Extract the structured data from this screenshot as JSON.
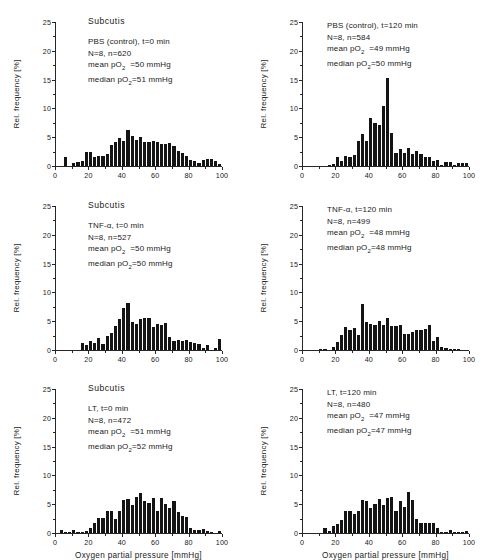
{
  "figure": {
    "xlabel": "Oxygen partial pressure [mmHg]",
    "ylabel": "Rel. frequency [%]",
    "xticks": [
      "0",
      "20",
      "40",
      "60",
      "80",
      "100"
    ],
    "yticks": [
      "0",
      "5",
      "10",
      "15",
      "20",
      "25"
    ],
    "tissue_title": "Subcutis"
  },
  "chart_data": [
    {
      "id": "pbs-t0",
      "type": "bar",
      "title": "Subcutis",
      "xlabel": "Oxygen partial pressure [mmHg]",
      "ylabel": "Rel. frequency [%]",
      "xlim": [
        0,
        100
      ],
      "ylim": [
        0,
        25
      ],
      "grid": false,
      "bin_width": 2.5,
      "annotations": {
        "condition": "PBS (control), t=0 min",
        "counts": "N=8, n=620",
        "mean": "mean pO2  =50 mmHg",
        "median": "median pO2=51 mmHg",
        "mean_value": 50,
        "median_value": 51,
        "N": 8,
        "n": 620
      },
      "x": [
        1.25,
        3.75,
        6.25,
        8.75,
        11.25,
        13.75,
        16.25,
        18.75,
        21.25,
        23.75,
        26.25,
        28.75,
        31.25,
        33.75,
        36.25,
        38.75,
        41.25,
        43.75,
        46.25,
        48.75,
        51.25,
        53.75,
        56.25,
        58.75,
        61.25,
        63.75,
        66.25,
        68.75,
        71.25,
        73.75,
        76.25,
        78.75,
        81.25,
        83.75,
        86.25,
        88.75,
        91.25,
        93.75,
        96.25,
        98.75
      ],
      "values": [
        0,
        0,
        1.5,
        0,
        0.5,
        0.7,
        0.8,
        2.4,
        2.5,
        1.5,
        1.7,
        1.8,
        2.0,
        3.6,
        4.1,
        4.9,
        4.3,
        6.2,
        5.2,
        4.5,
        5.1,
        4.2,
        4.2,
        4.3,
        4.1,
        3.9,
        3.9,
        4.0,
        3.5,
        2.6,
        2.3,
        1.7,
        1.0,
        0.8,
        0.5,
        1.1,
        1.2,
        1.3,
        0.9,
        0.4
      ]
    },
    {
      "id": "pbs-t120",
      "type": "bar",
      "title": "",
      "xlabel": "Oxygen partial pressure [mmHg]",
      "ylabel": "Rel. frequency [%]",
      "xlim": [
        0,
        100
      ],
      "ylim": [
        0,
        25
      ],
      "grid": false,
      "bin_width": 2.5,
      "annotations": {
        "condition": "PBS (control), t=120 min",
        "counts": "N=8, n=584",
        "mean": "mean pO2  =49 mmHg",
        "median": "median pO2=50 mmHg",
        "mean_value": 49,
        "median_value": 50,
        "N": 8,
        "n": 584
      },
      "x": [
        1.25,
        3.75,
        6.25,
        8.75,
        11.25,
        13.75,
        16.25,
        18.75,
        21.25,
        23.75,
        26.25,
        28.75,
        31.25,
        33.75,
        36.25,
        38.75,
        41.25,
        43.75,
        46.25,
        48.75,
        51.25,
        53.75,
        56.25,
        58.75,
        61.25,
        63.75,
        66.25,
        68.75,
        71.25,
        73.75,
        76.25,
        78.75,
        81.25,
        83.75,
        86.25,
        88.75,
        91.25,
        93.75,
        96.25,
        98.75
      ],
      "values": [
        0,
        0,
        0,
        0,
        0,
        0,
        0.2,
        0.3,
        1.5,
        0.9,
        1.8,
        1.5,
        1.9,
        4.3,
        5.6,
        4.4,
        8.4,
        7.4,
        7.1,
        10.5,
        15.3,
        5.8,
        2.2,
        3.0,
        2.2,
        3.2,
        2.0,
        2.6,
        2.0,
        1.6,
        1.5,
        0.9,
        1.0,
        0.2,
        0.7,
        0.7,
        0.1,
        0.5,
        0.5,
        0.5
      ]
    },
    {
      "id": "tnf-t0",
      "type": "bar",
      "title": "Subcutis",
      "xlabel": "Oxygen partial pressure [mmHg]",
      "ylabel": "Rel. frequency [%]",
      "xlim": [
        0,
        100
      ],
      "ylim": [
        0,
        25
      ],
      "grid": false,
      "bin_width": 2.5,
      "annotations": {
        "condition": "TNF-α, t=0 min",
        "counts": "N=8, n=527",
        "mean": "mean pO2  =50 mmHg",
        "median": "median pO2=50 mmHg",
        "mean_value": 50,
        "median_value": 50,
        "N": 8,
        "n": 527
      },
      "x": [
        1.25,
        3.75,
        6.25,
        8.75,
        11.25,
        13.75,
        16.25,
        18.75,
        21.25,
        23.75,
        26.25,
        28.75,
        31.25,
        33.75,
        36.25,
        38.75,
        41.25,
        43.75,
        46.25,
        48.75,
        51.25,
        53.75,
        56.25,
        58.75,
        61.25,
        63.75,
        66.25,
        68.75,
        71.25,
        73.75,
        76.25,
        78.75,
        81.25,
        83.75,
        86.25,
        88.75,
        91.25,
        93.75,
        96.25,
        98.75
      ],
      "values": [
        0,
        0,
        0,
        0,
        0,
        0,
        1.2,
        0.8,
        1.6,
        1.2,
        2.0,
        1.1,
        2.4,
        3.0,
        4.2,
        5.4,
        7.3,
        8.1,
        4.8,
        4.5,
        5.4,
        5.6,
        5.5,
        4.0,
        4.6,
        4.3,
        4.7,
        2.3,
        1.5,
        1.7,
        1.6,
        1.7,
        1.4,
        1.2,
        1.0,
        0.3,
        0.8,
        0,
        0.4,
        1.9
      ]
    },
    {
      "id": "tnf-t120",
      "type": "bar",
      "title": "",
      "xlabel": "Oxygen partial pressure [mmHg]",
      "ylabel": "Rel. frequency [%]",
      "xlim": [
        0,
        100
      ],
      "ylim": [
        0,
        25
      ],
      "grid": false,
      "bin_width": 2.5,
      "annotations": {
        "condition": "TNF-α, t=120 min",
        "counts": "N=8, n=499",
        "mean": "mean pO2  =48 mmHg",
        "median": "median pO2=48 mmHg",
        "mean_value": 48,
        "median_value": 48,
        "N": 8,
        "n": 499
      },
      "x": [
        1.25,
        3.75,
        6.25,
        8.75,
        11.25,
        13.75,
        16.25,
        18.75,
        21.25,
        23.75,
        26.25,
        28.75,
        31.25,
        33.75,
        36.25,
        38.75,
        41.25,
        43.75,
        46.25,
        48.75,
        51.25,
        53.75,
        56.25,
        58.75,
        61.25,
        63.75,
        66.25,
        68.75,
        71.25,
        73.75,
        76.25,
        78.75,
        81.25,
        83.75,
        86.25,
        88.75,
        91.25,
        93.75,
        96.25,
        98.75
      ],
      "values": [
        0,
        0,
        0,
        0,
        0.2,
        0.2,
        0,
        0.5,
        1.4,
        2.6,
        4.0,
        3.4,
        3.8,
        2.6,
        8.0,
        4.8,
        4.5,
        4.3,
        5.1,
        4.4,
        5.6,
        4.1,
        4.2,
        4.4,
        2.8,
        2.8,
        3.1,
        3.4,
        3.5,
        3.6,
        4.3,
        1.6,
        2.2,
        0.6,
        0.3,
        0.2,
        0.2,
        0.2,
        0,
        0
      ]
    },
    {
      "id": "lt-t0",
      "type": "bar",
      "title": "Subcutis",
      "xlabel": "Oxygen partial pressure [mmHg]",
      "ylabel": "Rel. frequency [%]",
      "xlim": [
        0,
        100
      ],
      "ylim": [
        0,
        25
      ],
      "grid": false,
      "bin_width": 2.5,
      "annotations": {
        "condition": "LT, t=0 min",
        "counts": "N=8, n=472",
        "mean": "mean pO2  =51 mmHg",
        "median": "median pO2=52 mmHg",
        "mean_value": 51,
        "median_value": 52,
        "N": 8,
        "n": 472
      },
      "x": [
        1.25,
        3.75,
        6.25,
        8.75,
        11.25,
        13.75,
        16.25,
        18.75,
        21.25,
        23.75,
        26.25,
        28.75,
        31.25,
        33.75,
        36.25,
        38.75,
        41.25,
        43.75,
        46.25,
        48.75,
        51.25,
        53.75,
        56.25,
        58.75,
        61.25,
        63.75,
        66.25,
        68.75,
        71.25,
        73.75,
        76.25,
        78.75,
        81.25,
        83.75,
        86.25,
        88.75,
        91.25,
        93.75,
        96.25,
        98.75
      ],
      "values": [
        0,
        0.5,
        0.2,
        0.2,
        0.6,
        0.2,
        0.2,
        0.3,
        0.8,
        1.7,
        2.6,
        2.6,
        3.8,
        3.9,
        2.4,
        3.8,
        5.8,
        5.9,
        4.8,
        6.3,
        7.0,
        5.6,
        5.2,
        6.0,
        3.9,
        6.0,
        5.0,
        4.4,
        5.6,
        3.7,
        2.9,
        2.7,
        0.9,
        0.6,
        0.6,
        0.7,
        0.3,
        0.2,
        0,
        0.4
      ]
    },
    {
      "id": "lt-t120",
      "type": "bar",
      "title": "",
      "xlabel": "Oxygen partial pressure [mmHg]",
      "ylabel": "Rel. frequency [%]",
      "xlim": [
        0,
        100
      ],
      "ylim": [
        0,
        25
      ],
      "grid": false,
      "bin_width": 2.5,
      "annotations": {
        "condition": "LT, t=120 min",
        "counts": "N=8, n=480",
        "mean": "mean pO2  =47 mmHg",
        "median": "median pO2=47 mmHg",
        "mean_value": 47,
        "median_value": 47,
        "N": 8,
        "n": 480
      },
      "x": [
        1.25,
        3.75,
        6.25,
        8.75,
        11.25,
        13.75,
        16.25,
        18.75,
        21.25,
        23.75,
        26.25,
        28.75,
        31.25,
        33.75,
        36.25,
        38.75,
        41.25,
        43.75,
        46.25,
        48.75,
        51.25,
        53.75,
        56.25,
        58.75,
        61.25,
        63.75,
        66.25,
        68.75,
        71.25,
        73.75,
        76.25,
        78.75,
        81.25,
        83.75,
        86.25,
        88.75,
        91.25,
        93.75,
        96.25,
        98.75
      ],
      "values": [
        0,
        0,
        0,
        0,
        0,
        0.8,
        0.3,
        1.2,
        1.6,
        2.2,
        3.8,
        3.8,
        3.3,
        3.8,
        5.8,
        5.6,
        4.4,
        5.1,
        5.9,
        4.9,
        6.1,
        6.2,
        3.9,
        5.5,
        4.5,
        7.1,
        5.8,
        2.4,
        1.7,
        1.8,
        1.8,
        1.7,
        0.8,
        0.1,
        0.1,
        0.5,
        0.1,
        0.1,
        0.1,
        0.3
      ]
    }
  ]
}
